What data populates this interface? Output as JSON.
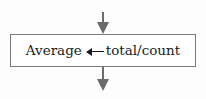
{
  "flowchart": {
    "process_box": {
      "variable": "Average",
      "assignment_symbol": "←",
      "expression": "total/count"
    },
    "incoming_arrow": "down-arrow",
    "outgoing_arrow": "down-arrow",
    "colors": {
      "arrow": "#6b6b6b",
      "border": "#7a7a7a",
      "text": "#1a1a1a"
    }
  }
}
